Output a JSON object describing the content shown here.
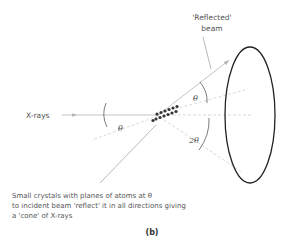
{
  "labels": {
    "reflected_line1": "'Reflected'",
    "reflected_line2": "beam",
    "xrays": "X-rays",
    "theta_left": "θ",
    "theta_upper": "θ",
    "two_theta": "2θ",
    "caption_line1": "Small crystals with planes of atoms at θ",
    "caption_line2": "to incident beam 'reflect' it in all directions giving",
    "caption_line3": "a 'cone' of X-rays",
    "figure_label": "(b)"
  },
  "colors": {
    "beam": "#b5b5b5",
    "dashed": "#c8c8c8",
    "ellipse": "#222222",
    "atoms": "#333333",
    "text": "#555555"
  }
}
